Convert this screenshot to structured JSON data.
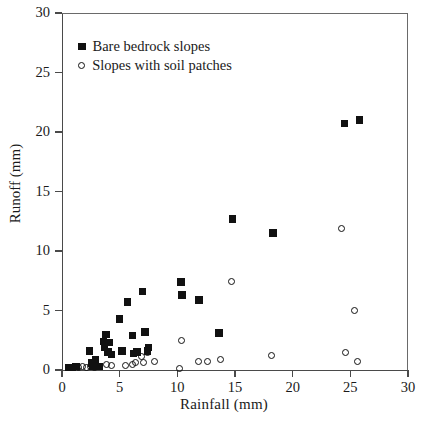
{
  "chart_data": {
    "type": "scatter",
    "title": "",
    "xlabel": "Rainfall (mm)",
    "ylabel": "Runoff (mm)",
    "xlim": [
      0,
      30
    ],
    "ylim": [
      0,
      30
    ],
    "xticks": [
      0,
      5,
      10,
      15,
      20,
      25,
      30
    ],
    "yticks": [
      0,
      5,
      10,
      15,
      20,
      25,
      30
    ],
    "xtick_labels": [
      "0",
      "5",
      "10",
      "15",
      "20",
      "25",
      "30"
    ],
    "ytick_labels": [
      "0",
      "5",
      "10",
      "15",
      "20",
      "25",
      "30"
    ],
    "grid": false,
    "legend_position": "upper left",
    "series": [
      {
        "name": "Bare bedrock slopes",
        "marker": "filled-square",
        "color": "#111111",
        "points": [
          [
            0.6,
            0.2
          ],
          [
            0.9,
            0.2
          ],
          [
            1.2,
            0.3
          ],
          [
            2.4,
            1.6
          ],
          [
            2.6,
            0.6
          ],
          [
            2.7,
            0.3
          ],
          [
            2.9,
            0.9
          ],
          [
            3.2,
            0.3
          ],
          [
            3.6,
            2.4
          ],
          [
            3.7,
            1.9
          ],
          [
            3.8,
            3.0
          ],
          [
            4.0,
            1.5
          ],
          [
            4.1,
            2.3
          ],
          [
            4.3,
            1.3
          ],
          [
            5.0,
            4.3
          ],
          [
            5.2,
            1.6
          ],
          [
            5.7,
            5.7
          ],
          [
            6.1,
            2.9
          ],
          [
            6.2,
            1.4
          ],
          [
            6.5,
            1.5
          ],
          [
            7.0,
            6.6
          ],
          [
            7.2,
            3.2
          ],
          [
            7.4,
            1.6
          ],
          [
            7.5,
            1.9
          ],
          [
            10.3,
            7.4
          ],
          [
            10.4,
            6.3
          ],
          [
            11.9,
            5.9
          ],
          [
            13.6,
            3.1
          ],
          [
            14.8,
            12.7
          ],
          [
            18.3,
            11.5
          ],
          [
            24.5,
            20.7
          ],
          [
            25.8,
            21.0
          ]
        ]
      },
      {
        "name": "Slopes with soil patches",
        "marker": "open-circle",
        "color": "#111111",
        "points": [
          [
            1.4,
            0.2
          ],
          [
            1.8,
            0.3
          ],
          [
            2.1,
            0.2
          ],
          [
            2.5,
            0.3
          ],
          [
            2.8,
            0.25
          ],
          [
            3.1,
            0.3
          ],
          [
            3.9,
            0.5
          ],
          [
            4.3,
            0.4
          ],
          [
            5.5,
            0.4
          ],
          [
            6.1,
            0.5
          ],
          [
            6.4,
            0.6
          ],
          [
            6.9,
            1.1
          ],
          [
            7.1,
            0.6
          ],
          [
            7.4,
            1.5
          ],
          [
            7.5,
            1.8
          ],
          [
            8.0,
            0.7
          ],
          [
            10.2,
            0.1
          ],
          [
            10.4,
            2.5
          ],
          [
            11.8,
            0.7
          ],
          [
            12.6,
            0.7
          ],
          [
            13.7,
            0.9
          ],
          [
            14.7,
            7.4
          ],
          [
            18.2,
            1.2
          ],
          [
            24.2,
            11.9
          ],
          [
            24.6,
            1.5
          ],
          [
            25.4,
            5.0
          ],
          [
            25.6,
            0.7
          ]
        ]
      }
    ]
  },
  "legend": {
    "entries": [
      {
        "label": "Bare bedrock slopes",
        "marker": "filled-square"
      },
      {
        "label": "Slopes with soil patches",
        "marker": "open-circle"
      }
    ]
  }
}
